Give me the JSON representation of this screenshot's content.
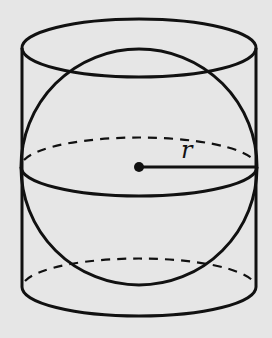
{
  "diagram": {
    "background_color": "#e6e6e6",
    "stroke_color": "#111111",
    "cylinder": {
      "left_x": 22,
      "right_x": 256,
      "top_center_y": 48,
      "bottom_center_y": 287,
      "ellipse_rx": 117,
      "ellipse_ry": 29,
      "bottom_back_style": "dashed"
    },
    "sphere": {
      "center_x": 139,
      "center_y": 167,
      "radius": 118,
      "equator_ry": 29,
      "equator_back_style": "dashed"
    },
    "radius_segment": {
      "from": [
        139,
        167
      ],
      "to": [
        256,
        167
      ],
      "label": "r"
    },
    "center_point": {
      "x": 139,
      "y": 167
    }
  }
}
